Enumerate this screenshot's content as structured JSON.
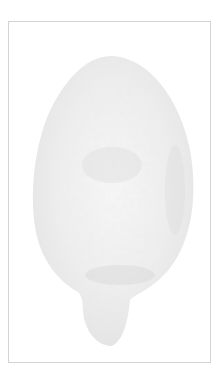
{
  "image": {
    "subject": "faint textured citrus fruit illustration",
    "frame_color": "#d4d4d4",
    "fruit_color": "#ebebeb",
    "shade_color": "#d9d9d9",
    "background": "#ffffff"
  }
}
